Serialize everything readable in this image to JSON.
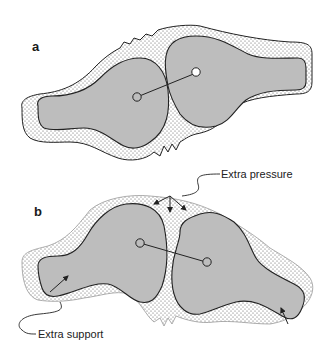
{
  "figure": {
    "panels": [
      {
        "id": "a",
        "label": "a",
        "description": "Two bones in a joint with uniform surrounding soft tissue (dotted)",
        "fill_color": "#bdbdbd",
        "soft_tissue_pattern": "dotted"
      },
      {
        "id": "b",
        "label": "b",
        "description": "Joint angled; soft tissue compressed with force arrows",
        "fill_color": "#bdbdbd",
        "soft_tissue_pattern": "dotted",
        "callouts": [
          {
            "id": "extra-pressure",
            "text": "Extra pressure"
          },
          {
            "id": "extra-support",
            "text": "Extra support"
          }
        ]
      }
    ],
    "colors": {
      "bone_fill": "#bdbdbd",
      "outline": "#222222",
      "dot": "#555555",
      "background": "#ffffff"
    }
  }
}
